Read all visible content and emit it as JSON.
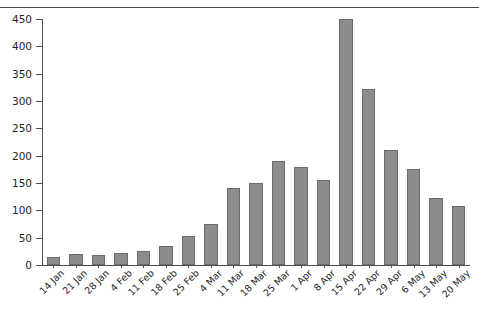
{
  "title_fragment": "",
  "chart_data": {
    "type": "bar",
    "title": "",
    "xlabel": "",
    "ylabel": "",
    "ylim": [
      0,
      450
    ],
    "ytick_step": 50,
    "grid": false,
    "legend": false,
    "bar_color": "#8c8c8c",
    "bar_edge_color": "#6b6b6b",
    "background": "#ffffff",
    "yticks": [
      0,
      50,
      100,
      150,
      200,
      250,
      300,
      350,
      400,
      450
    ],
    "ytick_labels": [
      "0",
      "50",
      "100",
      "150",
      "200",
      "250",
      "300",
      "350",
      "400",
      "450"
    ],
    "categories": [
      "14 Jan",
      "21 Jan",
      "28 Jan",
      "4 Feb",
      "11 Feb",
      "18 Feb",
      "25 Feb",
      "4 Mar",
      "11 Mar",
      "18 Mar",
      "25 Mar",
      "1 Apr",
      "8 Apr",
      "15 Apr",
      "22 Apr",
      "29 Apr",
      "6 May",
      "13 May",
      "20 May"
    ],
    "values": [
      14,
      20,
      18,
      22,
      26,
      35,
      53,
      75,
      140,
      150,
      190,
      180,
      155,
      450,
      322,
      210,
      175,
      122,
      108
    ]
  }
}
